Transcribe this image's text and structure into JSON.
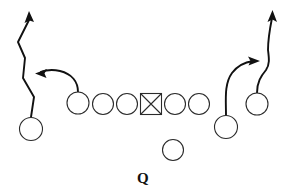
{
  "diagram": {
    "background_color": "#ffffff",
    "line_color": "#2b2b2b",
    "route_color": "#111111",
    "width": 286,
    "height": 192,
    "qb_label": "Q"
  },
  "players": [
    {
      "id": "left-wide-receiver",
      "label": "",
      "shape": "circle",
      "cx": 31,
      "cy": 129,
      "r": 11.5
    },
    {
      "id": "left-tight-end",
      "label": "",
      "shape": "circle",
      "cx": 78,
      "cy": 103,
      "r": 11.0
    },
    {
      "id": "left-tackle",
      "label": "",
      "shape": "circle",
      "cx": 103,
      "cy": 104,
      "r": 10.5
    },
    {
      "id": "left-guard",
      "label": "",
      "shape": "circle",
      "cx": 127,
      "cy": 104,
      "r": 10.5
    },
    {
      "id": "center",
      "label": "",
      "shape": "square",
      "cx": 151,
      "cy": 104,
      "size": 21
    },
    {
      "id": "right-guard",
      "label": "",
      "shape": "circle",
      "cx": 175,
      "cy": 104,
      "r": 10.5
    },
    {
      "id": "right-tackle",
      "label": "",
      "shape": "circle",
      "cx": 199,
      "cy": 104,
      "r": 10.5
    },
    {
      "id": "quarterback",
      "label": "Q",
      "shape": "circle",
      "cx": 173,
      "cy": 150,
      "r": 10.5
    },
    {
      "id": "right-wide-receiver",
      "label": "",
      "shape": "circle",
      "cx": 226,
      "cy": 127,
      "r": 11.5
    },
    {
      "id": "right-slot-receiver",
      "label": "",
      "shape": "circle",
      "cx": 257,
      "cy": 104,
      "r": 11.0
    }
  ],
  "routes": [
    {
      "id": "left-wide-receiver-route",
      "description": "go route with inside stem jog upfield",
      "path": "M 31 117 L 34 97 L 23 78 L 25 58 L 18 42 L 30 18",
      "arrow": {
        "x": 29,
        "y": 13,
        "angle": -64
      }
    },
    {
      "id": "left-tight-end-drag-route",
      "description": "drag route breaking left across the formation",
      "path": "M 78 92 C 78 82, 72 74, 60 71 C 52 69, 46 70, 41 72",
      "arrow": {
        "x": 36,
        "y": 73,
        "angle": 192
      }
    },
    {
      "id": "right-wide-receiver-in-route",
      "description": "in-breaking route turning toward the middle",
      "path": "M 226 115 C 226 100, 224 84, 232 73 C 238 65, 246 62, 253 61",
      "arrow": {
        "x": 259,
        "y": 61,
        "angle": 0
      }
    },
    {
      "id": "right-slot-receiver-go-route",
      "description": "vertical go route with slight outside stem",
      "path": "M 257 93 C 257 82, 261 76, 266 70 C 270 64, 269 58, 268 50 C 268 38, 270 28, 272 18",
      "arrow": {
        "x": 272,
        "y": 12,
        "angle": -85
      }
    }
  ],
  "labels": [
    {
      "id": "qb-position-label",
      "text": "Q",
      "x": 137,
      "y": 183
    }
  ]
}
